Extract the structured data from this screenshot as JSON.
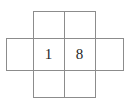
{
  "figure": {
    "line_color": "#8c8c8c",
    "text_color": "#262626",
    "background_color": "#ffffff",
    "canvas": {
      "width": 131,
      "height": 108
    },
    "unit": 31
  },
  "grid": {
    "x_positions": [
      6,
      33,
      64,
      95,
      123
    ],
    "y_positions": [
      11,
      38,
      70,
      97
    ],
    "horizontal_lines": [
      {
        "name": "top-edge-upper-squares",
        "x1": 33,
        "x2": 95,
        "y": 11
      },
      {
        "name": "top-edge-middle-band",
        "x1": 6,
        "x2": 123,
        "y": 38
      },
      {
        "name": "bottom-edge-middle-band",
        "x1": 6,
        "x2": 123,
        "y": 70
      },
      {
        "name": "bottom-edge-lower-squares",
        "x1": 33,
        "x2": 95,
        "y": 97
      }
    ],
    "vertical_lines": [
      {
        "name": "left-outer-edge",
        "x": 6,
        "y1": 38,
        "y2": 70
      },
      {
        "name": "left-inner-edge",
        "x": 33,
        "y1": 11,
        "y2": 97
      },
      {
        "name": "centre-edge",
        "x": 64,
        "y1": 11,
        "y2": 97
      },
      {
        "name": "right-inner-edge",
        "x": 95,
        "y1": 11,
        "y2": 97
      },
      {
        "name": "right-outer-edge",
        "x": 123,
        "y1": 38,
        "y2": 70
      }
    ]
  },
  "cells": [
    {
      "name": "cell-top-left",
      "row": "top",
      "col": 2,
      "label": "",
      "x": 33,
      "y": 11,
      "w": 31,
      "h": 27
    },
    {
      "name": "cell-top-right",
      "row": "top",
      "col": 3,
      "label": "",
      "x": 64,
      "y": 11,
      "w": 31,
      "h": 27
    },
    {
      "name": "cell-middle-far-left",
      "row": "middle",
      "col": 1,
      "label": "",
      "x": 6,
      "y": 38,
      "w": 27,
      "h": 32
    },
    {
      "name": "cell-middle-left",
      "row": "middle",
      "col": 2,
      "label": "1",
      "x": 33,
      "y": 38,
      "w": 31,
      "h": 32
    },
    {
      "name": "cell-middle-right",
      "row": "middle",
      "col": 3,
      "label": "8",
      "x": 64,
      "y": 38,
      "w": 31,
      "h": 32
    },
    {
      "name": "cell-middle-far-right",
      "row": "middle",
      "col": 4,
      "label": "",
      "x": 95,
      "y": 38,
      "w": 28,
      "h": 32
    },
    {
      "name": "cell-bottom-left",
      "row": "bottom",
      "col": 2,
      "label": "",
      "x": 33,
      "y": 70,
      "w": 31,
      "h": 27
    },
    {
      "name": "cell-bottom-right",
      "row": "bottom",
      "col": 3,
      "label": "",
      "x": 64,
      "y": 70,
      "w": 31,
      "h": 27
    }
  ],
  "labels": {
    "left_digit": "1",
    "right_digit": "8"
  }
}
